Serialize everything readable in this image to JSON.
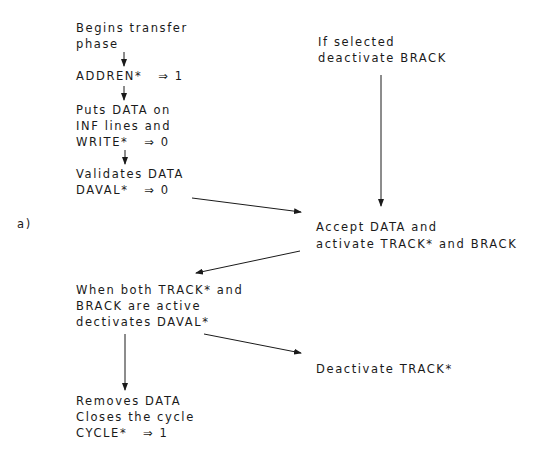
{
  "label": "a)",
  "left_flow": {
    "step1": [
      "Begins transfer",
      "phase"
    ],
    "step2": [
      "ADDREN*   ⇒ 1"
    ],
    "step3": [
      "Puts DATA on",
      "INF lines and",
      "WRITE*   ⇒ 0"
    ],
    "step4": [
      "Validates DATA",
      "DAVAL*   ⇒ 0"
    ],
    "step5": [
      "When both TRACK* and",
      "BRACK are active",
      "dectivates DAVAL*"
    ],
    "step6": [
      "Removes DATA",
      "Closes the cycle",
      "CYCLE*   ⇒ 1"
    ]
  },
  "right_flow": {
    "step1": [
      "If selected",
      "deactivate BRACK"
    ],
    "step2": [
      "Accept DATA and",
      "activate TRACK* and BRACK"
    ],
    "step3": [
      "Deactivate TRACK*"
    ]
  },
  "colors": {
    "line": "#1a1a1a",
    "background": "#ffffff"
  }
}
